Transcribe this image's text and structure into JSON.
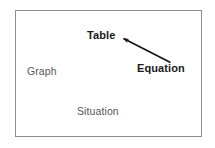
{
  "figure": {
    "background_color": "#ffffff",
    "frame": {
      "border_color": "#8e8e8e",
      "fill_color": "#ffffff"
    },
    "edge_artifact_text": "≡"
  },
  "labels": {
    "table": {
      "text": "Table",
      "weight": "bold",
      "color": "#1a1a1a"
    },
    "equation": {
      "text": "Equation",
      "weight": "bold",
      "color": "#1a1a1a"
    },
    "graph": {
      "text": "Graph",
      "weight": "normal",
      "color": "#575757"
    },
    "situation": {
      "text": "Situation",
      "weight": "normal",
      "color": "#575757"
    }
  },
  "connectors": [
    {
      "name": "equation-to-table-arrow",
      "from": "Equation",
      "to": "Table",
      "color": "#111111",
      "arrowhead_at": "Table"
    }
  ]
}
